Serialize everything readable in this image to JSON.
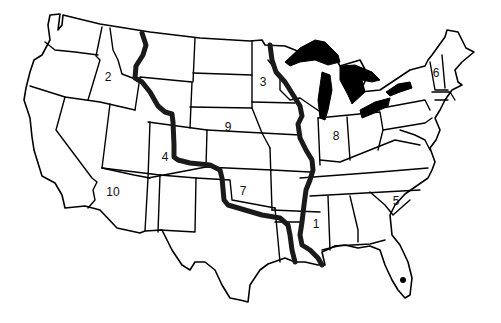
{
  "map": {
    "title": "United States regions map",
    "colors": {
      "outline": "#000000",
      "background": "#ffffff",
      "highlight": "#1a1a1a"
    },
    "regions": [
      {
        "label": "1",
        "x": 316,
        "y": 224
      },
      {
        "label": "2",
        "x": 108,
        "y": 77
      },
      {
        "label": "3",
        "x": 263,
        "y": 82
      },
      {
        "label": "4",
        "x": 165,
        "y": 157
      },
      {
        "label": "5",
        "x": 396,
        "y": 201
      },
      {
        "label": "6",
        "x": 436,
        "y": 73
      },
      {
        "label": "7",
        "x": 243,
        "y": 191
      },
      {
        "label": "8",
        "x": 336,
        "y": 136
      },
      {
        "label": "9",
        "x": 228,
        "y": 127
      },
      {
        "label": "10",
        "x": 113,
        "y": 192
      }
    ],
    "features": [
      "great-lakes",
      "mississippi-river",
      "continental-divide",
      "florida-dot"
    ]
  }
}
